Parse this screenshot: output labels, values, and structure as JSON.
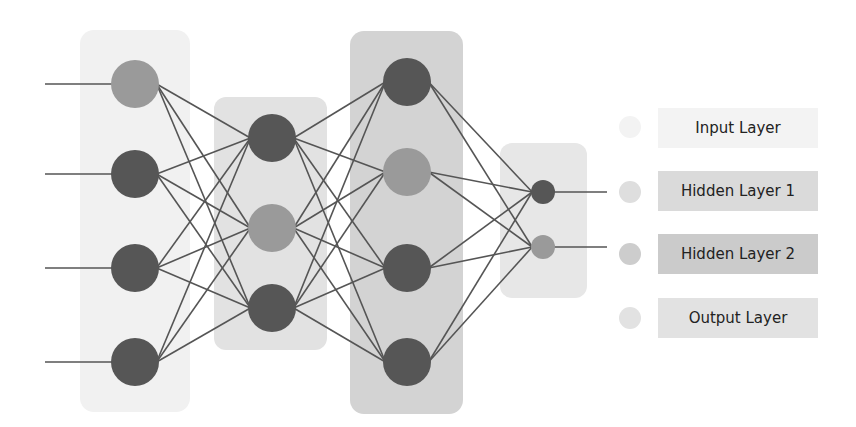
{
  "diagram": {
    "colors": {
      "node_dark": "#565656",
      "node_light": "#9a9a9a",
      "edge": "#555555",
      "input_box": "#f1f1f1",
      "hidden1_box": "#e2e2e2",
      "hidden2_box": "#d3d3d3",
      "output_box": "#e7e7e7"
    },
    "layers": [
      {
        "name": "Input Layer",
        "nodes": 4
      },
      {
        "name": "Hidden Layer 1",
        "nodes": 3
      },
      {
        "name": "Hidden Layer 2",
        "nodes": 4
      },
      {
        "name": "Output Layer",
        "nodes": 2
      }
    ]
  },
  "legend": {
    "items": [
      {
        "label": "Input Layer",
        "swatch": "#f3f3f3",
        "box": "#f3f3f3"
      },
      {
        "label": "Hidden Layer 1",
        "swatch": "#dedede",
        "box": "#dadada"
      },
      {
        "label": "Hidden Layer 2",
        "swatch": "#cdcdcd",
        "box": "#cbcbcb"
      },
      {
        "label": "Output Layer",
        "swatch": "#e2e2e2",
        "box": "#e2e2e2"
      }
    ]
  }
}
